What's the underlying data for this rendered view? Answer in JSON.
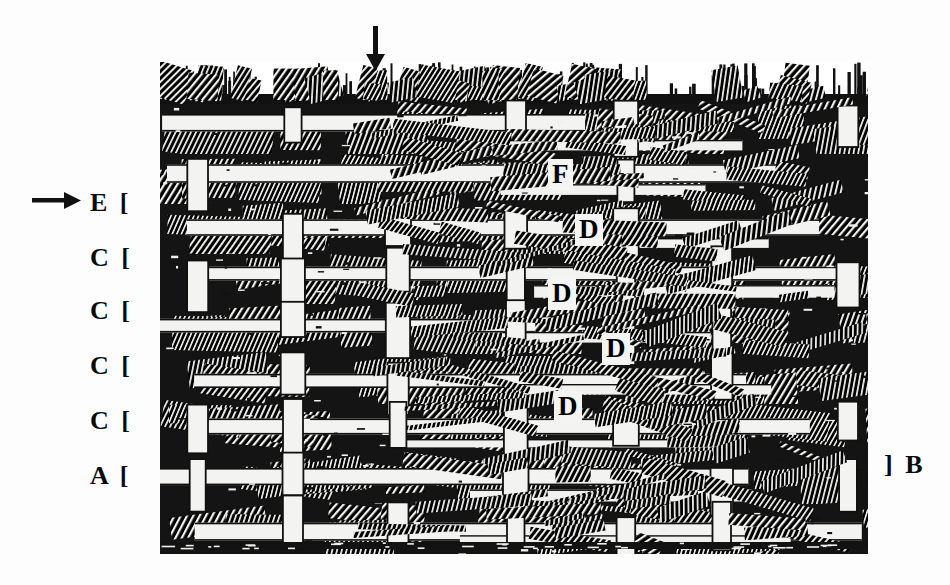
{
  "figure": {
    "kind": "cross-section-micrograph",
    "background_color": "#ffffff",
    "ink_color": "#000000",
    "frame": {
      "left": 160,
      "top": 62,
      "width": 708,
      "height": 492
    }
  },
  "annotations": {
    "top_arrow": {
      "name": "down-arrow",
      "glyph": "↓",
      "x": 362,
      "y": 26,
      "direction": "down"
    },
    "side_arrow": {
      "name": "right-arrow",
      "glyph": "→",
      "x": 32,
      "y": 188,
      "direction": "right"
    },
    "left_labels": [
      {
        "text": "E [",
        "letter": "E",
        "bracket": "[",
        "x": 90,
        "y": 190
      },
      {
        "text": "C [",
        "letter": "C",
        "bracket": "[",
        "x": 90,
        "y": 245
      },
      {
        "text": "C [",
        "letter": "C",
        "bracket": "[",
        "x": 90,
        "y": 298
      },
      {
        "text": "C [",
        "letter": "C",
        "bracket": "[",
        "x": 90,
        "y": 353
      },
      {
        "text": "C [",
        "letter": "C",
        "bracket": "[",
        "x": 90,
        "y": 408
      },
      {
        "text": "A [",
        "letter": "A",
        "bracket": "[",
        "x": 90,
        "y": 463
      }
    ],
    "right_labels": [
      {
        "text": "] B",
        "letter": "B",
        "bracket": "]",
        "x": 884,
        "y": 452
      }
    ],
    "interior_labels": [
      {
        "text": "F",
        "x": 549,
        "y": 160
      },
      {
        "text": "D",
        "x": 576,
        "y": 215
      },
      {
        "text": "D",
        "x": 549,
        "y": 279
      },
      {
        "text": "D",
        "x": 603,
        "y": 334
      },
      {
        "text": "D",
        "x": 555,
        "y": 392
      }
    ]
  },
  "texture": {
    "layer_count": 9,
    "stitch_column_count": 7,
    "seed": 20240517,
    "fringe_band_height": 40,
    "note": "Generated procedurally to reproduce the dense hatched weave texture of the original halftone scan."
  }
}
